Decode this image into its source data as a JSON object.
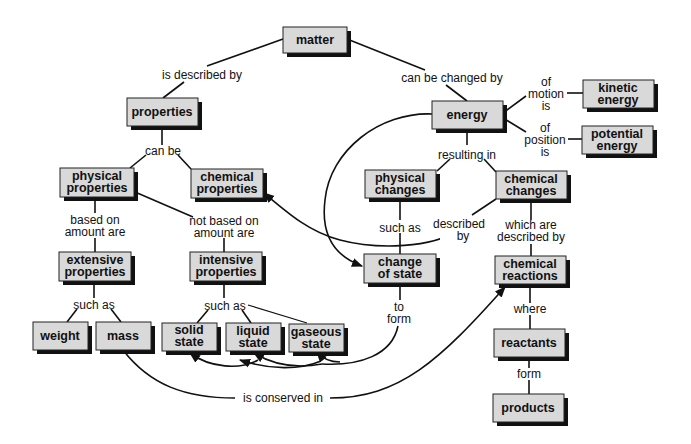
{
  "diagram": {
    "type": "concept-map",
    "colors": {
      "box_fill": "#d9d9d9",
      "box_shadow": "#111111",
      "line": "#111111",
      "background": "#ffffff"
    },
    "nodes": {
      "matter": {
        "lines": [
          "matter"
        ]
      },
      "properties": {
        "lines": [
          "properties"
        ]
      },
      "physical_properties": {
        "lines": [
          "physical",
          "properties"
        ]
      },
      "chemical_properties": {
        "lines": [
          "chemical",
          "properties"
        ]
      },
      "extensive_properties": {
        "lines": [
          "extensive",
          "properties"
        ]
      },
      "intensive_properties": {
        "lines": [
          "intensive",
          "properties"
        ]
      },
      "weight": {
        "lines": [
          "weight"
        ]
      },
      "mass": {
        "lines": [
          "mass"
        ]
      },
      "solid_state": {
        "lines": [
          "solid",
          "state"
        ]
      },
      "liquid_state": {
        "lines": [
          "liquid",
          "state"
        ]
      },
      "gaseous_state": {
        "lines": [
          "gaseous",
          "state"
        ]
      },
      "energy": {
        "lines": [
          "energy"
        ]
      },
      "kinetic_energy": {
        "lines": [
          "kinetic",
          "energy"
        ]
      },
      "potential_energy": {
        "lines": [
          "potential",
          "energy"
        ]
      },
      "physical_changes": {
        "lines": [
          "physical",
          "changes"
        ]
      },
      "chemical_changes": {
        "lines": [
          "chemical",
          "changes"
        ]
      },
      "change_of_state": {
        "lines": [
          "change",
          "of state"
        ]
      },
      "chemical_reactions": {
        "lines": [
          "chemical",
          "reactions"
        ]
      },
      "reactants": {
        "lines": [
          "reactants"
        ]
      },
      "products": {
        "lines": [
          "products"
        ]
      }
    },
    "links": {
      "is_described_by": {
        "lines": [
          "is described by"
        ]
      },
      "can_be_changed_by": {
        "lines": [
          "can be changed by"
        ]
      },
      "can_be": {
        "lines": [
          "can be"
        ]
      },
      "based_on_amount": {
        "lines": [
          "based on",
          "amount are"
        ]
      },
      "not_based_on_amount": {
        "lines": [
          "not based on",
          "amount are"
        ]
      },
      "such_as_extensive": {
        "lines": [
          "such as"
        ]
      },
      "such_as_intensive": {
        "lines": [
          "such as"
        ]
      },
      "of_motion_is": {
        "lines": [
          "of",
          "motion",
          "is"
        ]
      },
      "of_position_is": {
        "lines": [
          "of",
          "position",
          "is"
        ]
      },
      "resulting_in": {
        "lines": [
          "resulting in"
        ]
      },
      "such_as_physical": {
        "lines": [
          "such as"
        ]
      },
      "described_by": {
        "lines": [
          "described",
          "by"
        ]
      },
      "which_are_described_by": {
        "lines": [
          "which are",
          "described by"
        ]
      },
      "to_form": {
        "lines": [
          "to",
          "form"
        ]
      },
      "where": {
        "lines": [
          "where"
        ]
      },
      "form": {
        "lines": [
          "form"
        ]
      },
      "is_conserved_in": {
        "lines": [
          "is conserved in"
        ]
      }
    }
  }
}
